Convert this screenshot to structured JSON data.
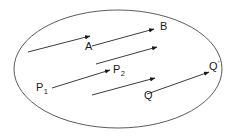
{
  "figure": {
    "kind": "vector-diagram",
    "background_color": "#ffffff",
    "stroke_color": "#4a4a4a",
    "arrow_color": "#1a1a1a",
    "text_color": "#1a1a1a",
    "boundary": {
      "name": "ellipse",
      "cx": 118,
      "cy": 69,
      "rx": 104,
      "ry": 59,
      "stroke_width": 0.9
    },
    "arrows": [
      {
        "id": "arrow-a",
        "label": "A",
        "x1": 28,
        "y1": 52,
        "x2": 90,
        "y2": 36
      },
      {
        "id": "arrow-b",
        "label": "B",
        "x1": 92,
        "y1": 46,
        "x2": 154,
        "y2": 29
      },
      {
        "id": "arrow-unlabeled-middle",
        "label": "",
        "x1": 96,
        "y1": 64,
        "x2": 157,
        "y2": 47
      },
      {
        "id": "arrow-p",
        "label": "",
        "x1": 52,
        "y1": 88,
        "x2": 110,
        "y2": 70
      },
      {
        "id": "arrow-q",
        "label": "",
        "x1": 92,
        "y1": 95,
        "x2": 155,
        "y2": 78
      },
      {
        "id": "arrow-q-prime",
        "label": "",
        "x1": 147,
        "y1": 94,
        "x2": 209,
        "y2": 72
      }
    ],
    "labels": [
      {
        "id": "label-a",
        "text": "A",
        "sub": "",
        "prime": "",
        "x": 85,
        "y": 50
      },
      {
        "id": "label-b",
        "text": "B",
        "sub": "",
        "prime": "",
        "x": 160,
        "y": 30
      },
      {
        "id": "label-p1",
        "text": "P",
        "sub": "1",
        "prime": "",
        "x": 36,
        "y": 91
      },
      {
        "id": "label-p2",
        "text": "P",
        "sub": "2",
        "prime": "",
        "x": 113,
        "y": 73
      },
      {
        "id": "label-q",
        "text": "Q",
        "sub": "",
        "prime": "",
        "x": 144,
        "y": 99
      },
      {
        "id": "label-q-prime",
        "text": "Q",
        "sub": "",
        "prime": "'",
        "x": 209,
        "y": 70
      }
    ]
  }
}
